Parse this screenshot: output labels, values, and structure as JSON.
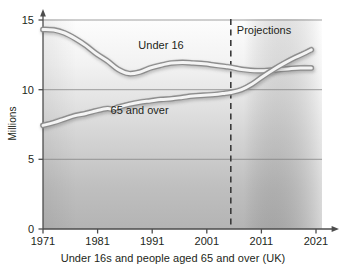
{
  "chart_data": {
    "type": "line",
    "title": "",
    "caption": "Under 16s and people aged 65 and over (UK)",
    "xlabel": "",
    "ylabel": "Millions",
    "xlim": [
      1971,
      2023
    ],
    "ylim": [
      0,
      15
    ],
    "yticks": [
      0,
      5,
      10,
      15
    ],
    "ytick_labels": [
      "0",
      "5",
      "10",
      "15"
    ],
    "xticks": [
      1971,
      1981,
      1991,
      2001,
      2011,
      2021
    ],
    "xtick_labels": [
      "1971",
      "1981",
      "1991",
      "2001",
      "2011",
      "2021"
    ],
    "grid": "horizontal",
    "legend_position": "inline-labels",
    "annotations": [
      {
        "name": "projections-divider",
        "label": "Projections",
        "x": 2006,
        "style": "dashed-vertical-line"
      }
    ],
    "series": [
      {
        "name": "Under 16",
        "label": "Under 16",
        "label_x": 1993,
        "label_y": 12.85,
        "x": [
          1971,
          1973,
          1975,
          1977,
          1979,
          1981,
          1983,
          1985,
          1987,
          1989,
          1991,
          1993,
          1995,
          1997,
          1999,
          2001,
          2003,
          2005,
          2006,
          2008,
          2011,
          2014,
          2017,
          2019,
          2021
        ],
        "values": [
          14.25,
          14.22,
          14.0,
          13.6,
          13.1,
          12.5,
          12.0,
          11.4,
          11.1,
          11.2,
          11.5,
          11.7,
          11.85,
          11.9,
          11.85,
          11.8,
          11.7,
          11.6,
          11.55,
          11.4,
          11.3,
          11.35,
          11.45,
          11.5,
          11.5
        ]
      },
      {
        "name": "65 and over",
        "label": "65 and over",
        "label_x": 1989,
        "label_y": 8.25,
        "x": [
          1971,
          1973,
          1975,
          1977,
          1979,
          1981,
          1983,
          1984,
          1985,
          1987,
          1989,
          1991,
          1993,
          1995,
          1997,
          1999,
          2001,
          2003,
          2005,
          2006,
          2008,
          2010,
          2012,
          2014,
          2016,
          2018,
          2020,
          2021
        ],
        "values": [
          7.4,
          7.6,
          7.85,
          8.1,
          8.25,
          8.45,
          8.6,
          8.55,
          8.7,
          8.9,
          9.05,
          9.15,
          9.25,
          9.3,
          9.4,
          9.5,
          9.55,
          9.6,
          9.7,
          9.75,
          9.95,
          10.35,
          10.9,
          11.4,
          11.85,
          12.25,
          12.6,
          12.8
        ]
      }
    ]
  },
  "figure": {
    "axis_y_title": "Millions",
    "caption": "Under 16s and people aged 65 and over (UK)"
  }
}
